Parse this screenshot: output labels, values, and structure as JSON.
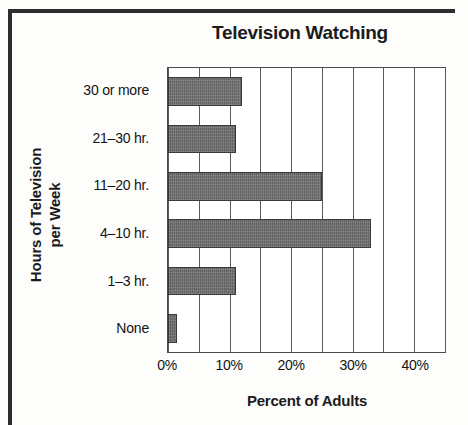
{
  "figure": {
    "background_color": "#fdfdfc",
    "border_color": "#2e2e2e"
  },
  "chart_data": {
    "type": "bar",
    "orientation": "horizontal",
    "title": "Television Watching",
    "xlabel": "Percent of Adults",
    "ylabel": "Hours of Television per Week",
    "ylabel_line1": "Hours of Television",
    "ylabel_line2": "per Week",
    "categories": [
      "None",
      "1–3 hr.",
      "4–10 hr.",
      "11–20 hr.",
      "21–30 hr.",
      "30 or more"
    ],
    "values": [
      1.5,
      11,
      33,
      25,
      11,
      12
    ],
    "xlim": [
      0,
      45
    ],
    "xtick_values": [
      0,
      10,
      20,
      30,
      40
    ],
    "xtick_labels": [
      "0%",
      "10%",
      "20%",
      "30%",
      "40%"
    ],
    "gridline_values": [
      0,
      5,
      10,
      15,
      20,
      25,
      30,
      35,
      40,
      45
    ],
    "grid": true,
    "legend": null,
    "bar_color": "#6e6e6e",
    "bar_border_color": "#3a3a3a",
    "axis_color": "#4a4a4a"
  }
}
